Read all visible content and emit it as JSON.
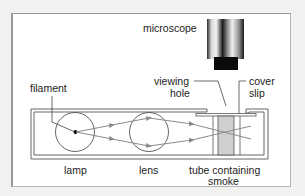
{
  "diagram": {
    "labels": {
      "microscope": "microscope",
      "filament": "filament",
      "viewing_hole_1": "viewing",
      "viewing_hole_2": "hole",
      "cover_slip_1": "cover",
      "cover_slip_2": "slip",
      "lamp": "lamp",
      "lens": "lens",
      "tube_1": "tube containing",
      "tube_2": "smoke"
    },
    "components": [
      "microscope",
      "filament",
      "lamp",
      "lens",
      "viewing hole",
      "cover slip",
      "tube containing smoke"
    ],
    "colors": {
      "background": "#f1f1f0",
      "panel": "#ffffff",
      "line": "#555555",
      "ray": "#8a8a8a",
      "smoke": "#cfcfcf",
      "microscope_tip": "#0a0a0a"
    }
  }
}
